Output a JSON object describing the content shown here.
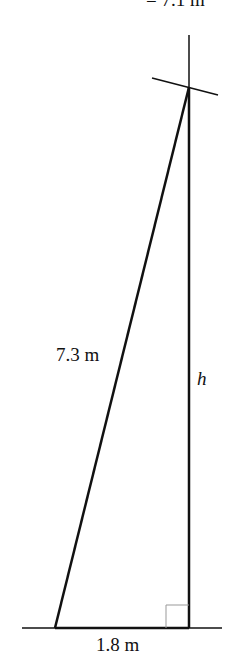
{
  "diagram": {
    "top_label": "= 7.1 m",
    "hypotenuse_label": "7.3 m",
    "height_label": "h",
    "base_label": "1.8 m",
    "colors": {
      "line": "#111111",
      "right_angle": "#999999"
    }
  }
}
